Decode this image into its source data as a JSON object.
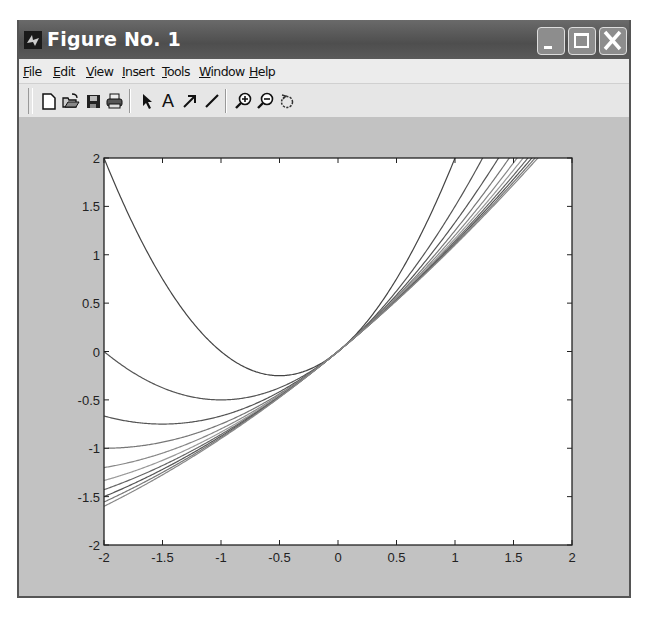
{
  "window": {
    "title": "Figure No. 1",
    "controls": {
      "minimize": "minimize",
      "maximize": "maximize",
      "close": "close"
    }
  },
  "menubar": {
    "items": [
      {
        "label": "File",
        "mnemonic": "F"
      },
      {
        "label": "Edit",
        "mnemonic": "E"
      },
      {
        "label": "View",
        "mnemonic": "V"
      },
      {
        "label": "Insert",
        "mnemonic": "I"
      },
      {
        "label": "Tools",
        "mnemonic": "T"
      },
      {
        "label": "Window",
        "mnemonic": "W"
      },
      {
        "label": "Help",
        "mnemonic": "H"
      }
    ]
  },
  "toolbar": {
    "buttons": [
      {
        "icon": "new-file-icon"
      },
      {
        "icon": "open-folder-icon"
      },
      {
        "icon": "save-icon"
      },
      {
        "icon": "print-icon"
      },
      {
        "icon": "select-arrow-icon"
      },
      {
        "icon": "insert-text-icon",
        "glyph": "A"
      },
      {
        "icon": "insert-arrow-icon"
      },
      {
        "icon": "insert-line-icon"
      },
      {
        "icon": "zoom-in-icon"
      },
      {
        "icon": "zoom-out-icon"
      },
      {
        "icon": "rotate-icon"
      }
    ]
  },
  "colors": {
    "titlebar": "#555555",
    "figure_bg": "#c2c2c2",
    "axes_bg": "#ffffff",
    "line": "#555555"
  },
  "chart_data": {
    "type": "line",
    "title": "",
    "xlabel": "",
    "ylabel": "",
    "xlim": [
      -2,
      2
    ],
    "ylim": [
      -2,
      2
    ],
    "xticks": [
      "-2",
      "-1.5",
      "-1",
      "-0.5",
      "0",
      "0.5",
      "1",
      "1.5",
      "2"
    ],
    "yticks": [
      "-2",
      "-1.5",
      "-1",
      "-0.5",
      "0",
      "0.5",
      "1",
      "1.5",
      "2"
    ],
    "grid": false,
    "legend": null,
    "series": [
      {
        "name": "n=1",
        "n": 1,
        "y_at_x_-2": 2.0
      },
      {
        "name": "n=2",
        "n": 2,
        "y_at_x_-2": 0.0
      },
      {
        "name": "n=3",
        "n": 3,
        "y_at_x_-2": -0.667
      },
      {
        "name": "n=4",
        "n": 4,
        "y_at_x_-2": -1.0
      },
      {
        "name": "n=5",
        "n": 5,
        "y_at_x_-2": -1.2
      },
      {
        "name": "n=6",
        "n": 6,
        "y_at_x_-2": -1.333
      },
      {
        "name": "n=7",
        "n": 7,
        "y_at_x_-2": -1.429
      },
      {
        "name": "n=8",
        "n": 8,
        "y_at_x_-2": -1.5
      },
      {
        "name": "n=9",
        "n": 9,
        "y_at_x_-2": -1.556
      },
      {
        "name": "n=10",
        "n": 10,
        "y_at_x_-2": -1.6
      }
    ]
  }
}
